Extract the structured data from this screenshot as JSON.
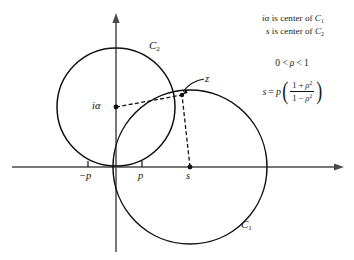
{
  "figure": {
    "background_color": "#ffffff",
    "stroke_color": "#111111"
  },
  "axes": {
    "x_axis_name": "real-axis",
    "y_axis_name": "imaginary-axis",
    "origin_px": [
      116,
      167
    ],
    "tick_labels": [
      {
        "id": "neg-p",
        "text": "−p",
        "x_px": 88
      },
      {
        "id": "pos-p",
        "text": "p",
        "x_px": 142
      }
    ]
  },
  "points": [
    {
      "id": "ia",
      "label": "iα",
      "role": "center of C₂ (drawn)",
      "x_px": 116,
      "y_px": 107
    },
    {
      "id": "z",
      "label": "z",
      "role": "intersection point",
      "x_px": 182,
      "y_px": 95
    },
    {
      "id": "s",
      "label": "s",
      "role": "center of C₁ (drawn)",
      "x_px": 190,
      "y_px": 167
    }
  ],
  "circles": [
    {
      "id": "C2",
      "label": "C",
      "subscript": "2",
      "cx_px": 116,
      "cy_px": 107,
      "r_px": 59
    },
    {
      "id": "C1",
      "label": "C",
      "subscript": "1",
      "cx_px": 190,
      "cy_px": 167,
      "r_px": 77
    }
  ],
  "labels": {
    "c1": {
      "base": "C",
      "sub": "1"
    },
    "c2": {
      "base": "C",
      "sub": "2"
    },
    "ia": "iα",
    "z": "z",
    "neg_p": "−p",
    "p": "p",
    "s": "s"
  },
  "annotations": {
    "line1": {
      "lead": "iα",
      "text": " is center of ",
      "symbol": "C",
      "sub": "1"
    },
    "line2": {
      "lead": "s",
      "text": " is center of ",
      "symbol": "C",
      "sub": "2"
    },
    "condition": {
      "left": "0 <",
      "rho": "ρ",
      "right": "< 1"
    },
    "formula": {
      "lhs": "s",
      "eq": "=",
      "coef": "p",
      "open_paren": "(",
      "close_paren": ")",
      "numerator": {
        "one": "1 +",
        "rho": "ρ",
        "exp": "2"
      },
      "denominator": {
        "one": "1 −",
        "rho": "ρ",
        "exp": "2"
      }
    }
  }
}
